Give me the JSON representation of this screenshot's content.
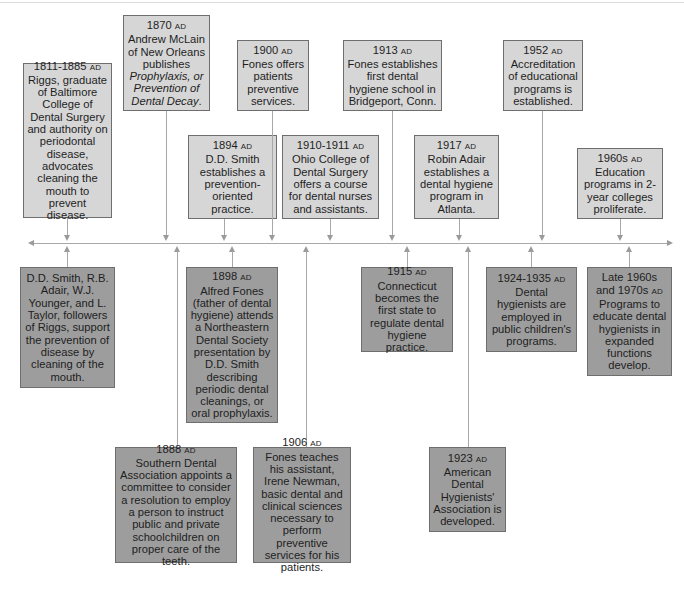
{
  "diagram": {
    "type": "timeline",
    "colors": {
      "above_box": "#d6d6d6",
      "below_box": "#9d9d9d",
      "border": "#6e6e6e",
      "line": "#a8a8a8"
    },
    "above": [
      {
        "date": "1811-1885",
        "era": "AD",
        "text": "Riggs, graduate of Baltimore College of Dental Surgery and authority on periodontal disease, advocates cleaning the mouth to prevent disease."
      },
      {
        "date": "1870",
        "era": "AD",
        "text": "Andrew McLain of New Orleans publishes",
        "italic": "Prophylaxis, or Prevention of Dental Decay",
        "tail": "."
      },
      {
        "date": "1894",
        "era": "AD",
        "text": "D.D. Smith establishes a prevention-oriented practice."
      },
      {
        "date": "1900",
        "era": "AD",
        "text": "Fones offers patients preventive services."
      },
      {
        "date": "1910-1911",
        "era": "AD",
        "text": "Ohio College of Dental Surgery offers a course for dental nurses and assistants."
      },
      {
        "date": "1913",
        "era": "AD",
        "text": "Fones establishes first dental hygiene school in Bridgeport, Conn."
      },
      {
        "date": "1917",
        "era": "AD",
        "text": "Robin Adair establishes a dental hygiene program in Atlanta."
      },
      {
        "date": "1952",
        "era": "AD",
        "text": "Accreditation of educational programs is established."
      },
      {
        "date": "1960s",
        "era": "AD",
        "text": "Education programs in 2-year colleges proliferate."
      }
    ],
    "below": [
      {
        "date": "",
        "era": "",
        "text": "D.D. Smith, R.B. Adair, W.J. Younger, and L. Taylor, followers of Riggs, support the prevention of disease by cleaning of the mouth."
      },
      {
        "date": "1888",
        "era": "AD",
        "text": "Southern Dental Association appoints a committee to consider a resolution to employ a person to instruct public and private schoolchildren on proper care of the teeth."
      },
      {
        "date": "1898",
        "era": "AD",
        "text": "Alfred Fones (father of dental hygiene) attends a Northeastern Dental Society presentation by D.D. Smith describing periodic dental cleanings, or oral prophylaxis."
      },
      {
        "date": "1906",
        "era": "AD",
        "text": "Fones teaches his assistant, Irene Newman, basic dental and clinical sciences necessary to perform preventive services for his patients."
      },
      {
        "date": "1915",
        "era": "AD",
        "text": "Connecticut becomes the first state to regulate dental hygiene practice."
      },
      {
        "date": "1923",
        "era": "AD",
        "text": "American Dental Hygienists' Association is developed."
      },
      {
        "date": "1924-1935",
        "era": "AD",
        "text": "Dental hygienists are employed in public children's programs."
      },
      {
        "date": "Late 1960s and 1970s",
        "era": "AD",
        "text": "Programs to educate dental hygienists in expanded functions develop."
      }
    ]
  }
}
